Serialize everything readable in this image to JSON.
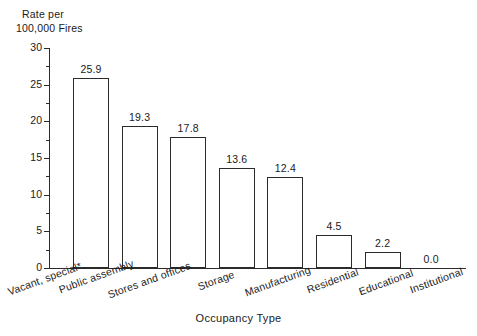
{
  "chart_data": {
    "type": "bar",
    "title": "",
    "subtitle": "",
    "xlabel": "Occupancy Type",
    "ylabel_line1": "Rate per",
    "ylabel_line2": "100,000 Fires",
    "categories": [
      "Vacant, special*",
      "Public assembly",
      "Stores and offices",
      "Storage",
      "Manufacturing",
      "Residential",
      "Educational",
      "Institutional"
    ],
    "values": [
      25.9,
      19.3,
      17.8,
      13.6,
      12.4,
      4.5,
      2.2,
      0.0
    ],
    "value_labels": [
      "25.9",
      "19.3",
      "17.8",
      "13.6",
      "12.4",
      "4.5",
      "2.2",
      "0.0"
    ],
    "ylim": [
      0,
      30
    ],
    "y_ticks": [
      0,
      5,
      10,
      15,
      20,
      25,
      30
    ],
    "y_tick_labels": [
      "0",
      "5",
      "10",
      "15",
      "20",
      "25",
      "30"
    ],
    "y_minor_ticks": [
      2.5,
      7.5,
      12.5,
      17.5,
      22.5,
      27.5
    ],
    "grid": false,
    "legend": "none",
    "bar_fill": "#ffffff",
    "bar_edge": "#2b2b2b",
    "axis_color": "#2b2b2b",
    "background": "#ffffff",
    "label_rotation_deg": -20,
    "footnote_marker": "*"
  }
}
